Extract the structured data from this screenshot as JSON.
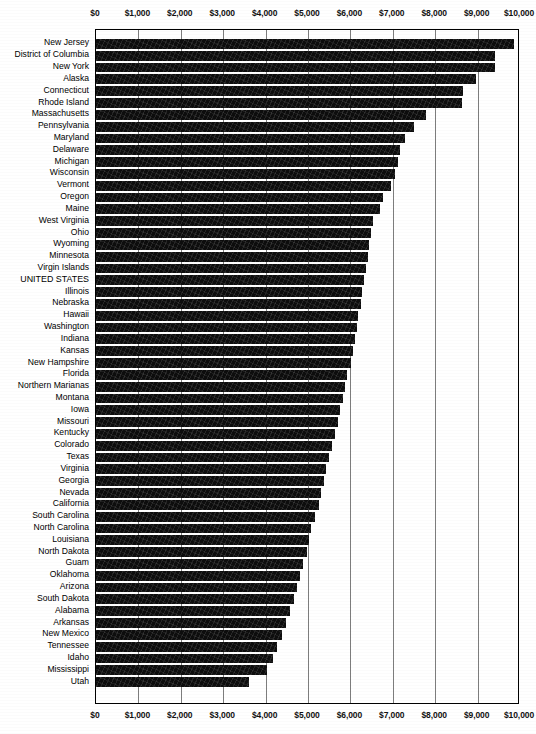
{
  "chart_data": {
    "type": "bar",
    "orientation": "horizontal",
    "title": "",
    "subtitle": "",
    "xlabel": "",
    "ylabel": "",
    "xlim": [
      0,
      10000
    ],
    "grid": true,
    "legend": false,
    "tick_labels": [
      "$0",
      "$1,000",
      "$2,000",
      "$3,000",
      "$4,000",
      "$5,000",
      "$6,000",
      "$7,000",
      "$8,000",
      "$9,000",
      "$10,000"
    ],
    "tick_values": [
      0,
      1000,
      2000,
      3000,
      4000,
      5000,
      6000,
      7000,
      8000,
      9000,
      10000
    ],
    "axis_position": [
      "top",
      "bottom"
    ],
    "highlight_category": "UNITED STATES",
    "categories": [
      "New Jersey",
      "District of Columbia",
      "New York",
      "Alaska",
      "Connecticut",
      "Rhode Island",
      "Massachusetts",
      "Pennsylvania",
      "Maryland",
      "Delaware",
      "Michigan",
      "Wisconsin",
      "Vermont",
      "Oregon",
      "Maine",
      "West Virginia",
      "Ohio",
      "Wyoming",
      "Minnesota",
      "Virgin Islands",
      "UNITED STATES",
      "Illinois",
      "Nebraska",
      "Hawaii",
      "Washington",
      "Indiana",
      "Kansas",
      "New Hampshire",
      "Florida",
      "Northern Marianas",
      "Montana",
      "Iowa",
      "Missouri",
      "Kentucky",
      "Colorado",
      "Texas",
      "Virginia",
      "Georgia",
      "Nevada",
      "California",
      "South Carolina",
      "North Carolina",
      "Louisiana",
      "North Dakota",
      "Guam",
      "Oklahoma",
      "Arizona",
      "South Dakota",
      "Alabama",
      "Arkansas",
      "New Mexico",
      "Tennessee",
      "Idaho",
      "Mississippi",
      "Utah"
    ],
    "values": [
      9860,
      9410,
      9400,
      8960,
      8660,
      8640,
      7790,
      7500,
      7290,
      7180,
      7120,
      7050,
      6960,
      6760,
      6700,
      6530,
      6480,
      6450,
      6410,
      6370,
      6330,
      6280,
      6240,
      6190,
      6150,
      6100,
      6060,
      6010,
      5930,
      5870,
      5820,
      5760,
      5700,
      5640,
      5560,
      5500,
      5430,
      5370,
      5310,
      5250,
      5160,
      5080,
      5030,
      4970,
      4890,
      4810,
      4740,
      4660,
      4570,
      4480,
      4380,
      4280,
      4180,
      4040,
      3610
    ]
  }
}
